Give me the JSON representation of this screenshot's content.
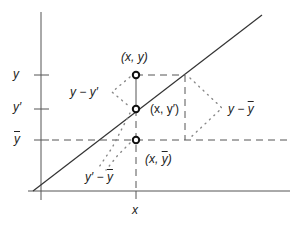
{
  "diagram": {
    "title": "",
    "axes": {
      "x_label": "x",
      "y_ticks": [
        {
          "label": "y",
          "y": 75
        },
        {
          "label": "y′",
          "y": 109
        },
        {
          "label": "ȳ",
          "y": 140
        }
      ]
    },
    "points": [
      {
        "label": "(x, y)",
        "name": "observed"
      },
      {
        "label": "(x, y′)",
        "name": "predicted"
      },
      {
        "label": "(x, ȳ)",
        "name": "mean"
      }
    ],
    "braces": [
      {
        "label": "y − y′",
        "name": "unexplained"
      },
      {
        "label": "y − ȳ",
        "name": "total"
      },
      {
        "label": "y′ − ȳ",
        "name": "explained"
      }
    ],
    "colors": {
      "line": "#333333",
      "dashed": "#555555",
      "dots": "#888888"
    }
  },
  "labels": {
    "tick_y": "y",
    "tick_yprime": "y′",
    "tick_ybar": "y",
    "x_axis": "x",
    "pt_xy": "(x, y)",
    "pt_xyprime": "(x, y′)",
    "pt_xybar_pre": "(x, ",
    "pt_xybar_y": "y",
    "pt_xybar_post": ")",
    "brace_y_yprime": "y − y′",
    "brace_y_ybar_pre": "y − ",
    "brace_y_ybar_y": "y",
    "brace_yprime_ybar_pre": "y′ − ",
    "brace_yprime_ybar_y": "y"
  }
}
